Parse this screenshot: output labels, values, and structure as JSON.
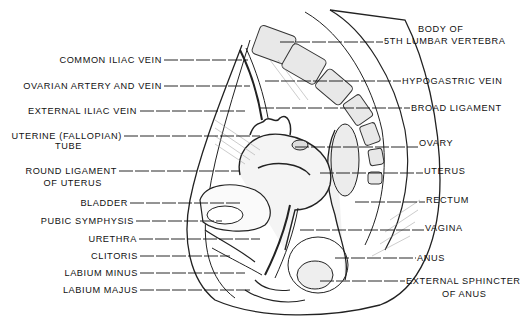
{
  "figure": {
    "left_labels": [
      {
        "text": "COMMON  ILIAC  VEIN",
        "x": 0,
        "y": 55,
        "w": 162
      },
      {
        "text": "OVARIAN  ARTERY  AND  VEIN",
        "x": 0,
        "y": 81,
        "w": 162
      },
      {
        "text": "EXTERNAL  ILIAC  VEIN",
        "x": 0,
        "y": 106,
        "w": 137
      },
      {
        "text": "UTERINE (FALLOPIAN)",
        "x": 0,
        "y": 131,
        "w": 122
      },
      {
        "text": "TUBE",
        "x": 52,
        "y": 141,
        "w": 30
      },
      {
        "text": "ROUND  LIGAMENT",
        "x": 0,
        "y": 166,
        "w": 117
      },
      {
        "text": "OF  UTERUS",
        "x": 42,
        "y": 178,
        "w": 60
      },
      {
        "text": "BLADDER",
        "x": 0,
        "y": 198,
        "w": 128
      },
      {
        "text": "PUBIC  SYMPHYSIS",
        "x": 0,
        "y": 216,
        "w": 134
      },
      {
        "text": "URETHRA",
        "x": 0,
        "y": 234,
        "w": 137
      },
      {
        "text": "CLITORIS",
        "x": 0,
        "y": 251,
        "w": 138
      },
      {
        "text": "LABIUM  MINUS",
        "x": 0,
        "y": 268,
        "w": 138
      },
      {
        "text": "LABIUM  MAJUS",
        "x": 0,
        "y": 285,
        "w": 138
      }
    ],
    "right_labels": [
      {
        "text": "BODY  OF",
        "x": 418,
        "y": 24
      },
      {
        "text": "5TH  LUMBAR  VERTEBRA",
        "x": 384,
        "y": 36
      },
      {
        "text": "HYPOGASTRIC  VEIN",
        "x": 402,
        "y": 76
      },
      {
        "text": "BROAD  LIGAMENT",
        "x": 411,
        "y": 103
      },
      {
        "text": "OVARY",
        "x": 419,
        "y": 138
      },
      {
        "text": "UTERUS",
        "x": 424,
        "y": 166
      },
      {
        "text": "RECTUM",
        "x": 426,
        "y": 195
      },
      {
        "text": "VAGINA",
        "x": 425,
        "y": 223
      },
      {
        "text": "ANUS",
        "x": 417,
        "y": 253
      },
      {
        "text": "EXTERNAL  SPHINCTER",
        "x": 406,
        "y": 276
      },
      {
        "text": "OF  ANUS",
        "x": 442,
        "y": 289
      }
    ],
    "left_leaders": [
      [
        164,
        60,
        248,
        60
      ],
      [
        164,
        86,
        250,
        86
      ],
      [
        140,
        111,
        245,
        111
      ],
      [
        124,
        136,
        260,
        136
      ],
      [
        119,
        171,
        240,
        171
      ],
      [
        130,
        203,
        240,
        203
      ],
      [
        136,
        221,
        222,
        221
      ],
      [
        139,
        239,
        260,
        239
      ],
      [
        140,
        256,
        230,
        256
      ],
      [
        140,
        273,
        245,
        273
      ],
      [
        140,
        290,
        250,
        290
      ]
    ],
    "right_leaders": [
      [
        280,
        42,
        383,
        42
      ],
      [
        265,
        81,
        401,
        81
      ],
      [
        260,
        108,
        410,
        108
      ],
      [
        295,
        147,
        418,
        147
      ],
      [
        320,
        173,
        423,
        173
      ],
      [
        355,
        202,
        425,
        202
      ],
      [
        300,
        230,
        424,
        230
      ],
      [
        335,
        258,
        416,
        258
      ],
      [
        320,
        281,
        405,
        281
      ]
    ],
    "colors": {
      "ink": "#1a1a1a",
      "paper": "#ffffff",
      "shade": "#cfcfcf"
    }
  }
}
